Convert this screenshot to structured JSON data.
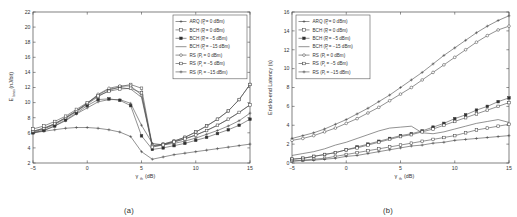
{
  "figure": {
    "panels": [
      {
        "caption": "(a)",
        "xlabel_main": "γ",
        "xlabel_sub": "th",
        "xlabel_unit": " (dB)",
        "ylabel_main": "E",
        "ylabel_sub": "bnos",
        "ylabel_unit": " (nJ/bit)"
      },
      {
        "caption": "(b)",
        "xlabel_main": "γ",
        "xlabel_sub": "th",
        "xlabel_unit": " (dB)",
        "ylabel_main": "End-to-end Latency (s)",
        "ylabel_sub": "",
        "ylabel_unit": ""
      }
    ],
    "legend_entries": [
      {
        "prefix": "ARQ (P",
        "sub": "t",
        "suffix": " = 0 dBm)",
        "marker": "plus"
      },
      {
        "prefix": "BCH (P",
        "sub": "t",
        "suffix": " = 0 dBm)",
        "marker": "square-open"
      },
      {
        "prefix": "BCH (P",
        "sub": "t",
        "suffix": " = −5 dBm)",
        "marker": "square-filled"
      },
      {
        "prefix": "BCH (P",
        "sub": "t",
        "suffix": " = −15 dBm)",
        "marker": "none"
      },
      {
        "prefix": "RS (P",
        "sub": "t",
        "suffix": " = 0 dBm)",
        "marker": "circle-open"
      },
      {
        "prefix": "RS (P",
        "sub": "t",
        "suffix": " = −5 dBm)",
        "marker": "square-open"
      },
      {
        "prefix": "RS (P",
        "sub": "t",
        "suffix": " = −15 dBm)",
        "marker": "plus"
      }
    ]
  },
  "chart_data": [
    {
      "type": "line",
      "panel": "a",
      "title": "",
      "xlabel": "γ_th (dB)",
      "ylabel": "E_bnos (nJ/bit)",
      "xlim": [
        -5,
        15
      ],
      "ylim": [
        2,
        22
      ],
      "xticks": [
        -5,
        0,
        5,
        10,
        15
      ],
      "yticks": [
        2,
        4,
        6,
        8,
        10,
        12,
        14,
        16,
        18,
        20,
        22
      ],
      "grid": false,
      "legend_position": "top-right",
      "x": [
        -5,
        -4,
        -3,
        -2,
        -1,
        0,
        1,
        2,
        3,
        4,
        5,
        6,
        7,
        8,
        9,
        10,
        11,
        12,
        13,
        14,
        15
      ],
      "series": [
        {
          "name": "ARQ (P_t = 0 dBm)",
          "marker": "plus",
          "values": [
            6.0,
            6.3,
            6.9,
            7.6,
            8.5,
            9.3,
            10.1,
            10.4,
            10.4,
            9.9,
            7.0,
            4.6,
            4.4,
            4.6,
            4.9,
            5.3,
            5.8,
            6.3,
            6.9,
            7.6,
            8.6
          ]
        },
        {
          "name": "BCH (P_t = 0 dBm)",
          "marker": "square-open",
          "values": [
            6.1,
            6.5,
            7.1,
            7.9,
            8.8,
            9.8,
            10.8,
            11.6,
            12.1,
            12.4,
            11.9,
            4.3,
            4.5,
            4.9,
            5.4,
            6.1,
            6.9,
            7.8,
            8.9,
            10.4,
            12.4
          ]
        },
        {
          "name": "BCH (P_t = −5 dBm)",
          "marker": "square-filled",
          "values": [
            6.0,
            6.3,
            6.9,
            7.7,
            8.6,
            9.6,
            10.4,
            10.5,
            10.3,
            9.6,
            5.6,
            3.8,
            4.0,
            4.3,
            4.6,
            5.0,
            5.4,
            5.9,
            6.4,
            7.0,
            7.8
          ]
        },
        {
          "name": "BCH (P_t = −15 dBm)",
          "marker": "none",
          "values": [
            6.2,
            6.6,
            7.2,
            8.0,
            8.9,
            9.9,
            11.0,
            11.8,
            12.0,
            11.8,
            10.7,
            4.2,
            4.4,
            4.8,
            5.2,
            5.7,
            6.3,
            7.0,
            7.8,
            8.7,
            9.7
          ]
        },
        {
          "name": "RS (P_t = 0 dBm)",
          "marker": "circle-open",
          "values": [
            6.2,
            6.6,
            7.2,
            8.0,
            8.9,
            9.9,
            11.1,
            11.9,
            12.2,
            12.2,
            11.0,
            4.3,
            4.5,
            4.9,
            5.4,
            6.1,
            6.9,
            7.8,
            8.9,
            10.4,
            12.4
          ]
        },
        {
          "name": "RS (P_t = −5 dBm)",
          "marker": "square-open",
          "values": [
            6.5,
            6.9,
            7.5,
            8.2,
            9.1,
            10.0,
            10.9,
            11.5,
            11.8,
            11.9,
            11.3,
            4.1,
            4.4,
            4.8,
            5.2,
            5.7,
            6.3,
            7.0,
            7.8,
            8.7,
            9.7
          ]
        },
        {
          "name": "RS (P_t = −15 dBm)",
          "marker": "plus",
          "values": [
            6.0,
            6.2,
            6.4,
            6.6,
            6.7,
            6.7,
            6.6,
            6.4,
            6.1,
            5.5,
            3.5,
            2.5,
            2.8,
            3.1,
            3.3,
            3.5,
            3.7,
            3.9,
            4.1,
            4.3,
            4.5
          ]
        }
      ]
    },
    {
      "type": "line",
      "panel": "b",
      "title": "",
      "xlabel": "γ_th (dB)",
      "ylabel": "End-to-end Latency (s)",
      "xlim": [
        -5,
        15
      ],
      "ylim": [
        0,
        16
      ],
      "xticks": [
        -5,
        0,
        5,
        10,
        15
      ],
      "yticks": [
        0,
        2,
        4,
        6,
        8,
        10,
        12,
        14,
        16
      ],
      "grid": false,
      "legend_position": "top-left",
      "x": [
        -5,
        -4,
        -3,
        -2,
        -1,
        0,
        1,
        2,
        3,
        4,
        5,
        6,
        7,
        8,
        9,
        10,
        11,
        12,
        13,
        14,
        15
      ],
      "series": [
        {
          "name": "ARQ (P_t = 0 dBm)",
          "marker": "plus",
          "values": [
            2.6,
            2.9,
            3.2,
            3.6,
            4.1,
            4.6,
            5.2,
            5.8,
            6.5,
            7.2,
            8.0,
            8.8,
            9.6,
            10.5,
            11.4,
            12.2,
            13.0,
            13.8,
            14.5,
            15.1,
            15.6
          ]
        },
        {
          "name": "BCH (P_t = 0 dBm)",
          "marker": "circle-open",
          "values": [
            2.4,
            2.6,
            2.9,
            3.3,
            3.7,
            4.2,
            4.7,
            5.3,
            5.9,
            6.6,
            7.3,
            8.0,
            8.8,
            9.6,
            10.4,
            11.2,
            12.0,
            12.8,
            13.5,
            14.1,
            14.5
          ]
        },
        {
          "name": "BCH (P_t = −5 dBm)",
          "marker": "square-filled",
          "values": [
            0.4,
            0.5,
            0.7,
            0.9,
            1.1,
            1.4,
            1.7,
            2.0,
            2.3,
            2.6,
            2.9,
            3.1,
            3.4,
            3.8,
            4.2,
            4.7,
            5.1,
            5.6,
            6.0,
            6.5,
            6.9
          ]
        },
        {
          "name": "BCH (P_t = −15 dBm)",
          "marker": "none",
          "values": [
            0.8,
            1.0,
            1.2,
            1.5,
            1.9,
            2.2,
            2.6,
            3.0,
            3.4,
            3.7,
            3.8,
            3.9,
            3.2,
            3.1,
            3.3,
            3.6,
            3.9,
            4.2,
            4.4,
            4.6,
            4.3
          ]
        },
        {
          "name": "RS (P_t = 0 dBm)",
          "marker": "square-open",
          "values": [
            0.4,
            0.5,
            0.7,
            0.9,
            1.1,
            1.4,
            1.6,
            1.9,
            2.2,
            2.5,
            2.8,
            3.0,
            3.3,
            3.6,
            4.0,
            4.4,
            4.8,
            5.2,
            5.6,
            6.0,
            6.4
          ]
        },
        {
          "name": "RS (P_t = −5 dBm)",
          "marker": "square-open",
          "values": [
            0.2,
            0.3,
            0.4,
            0.5,
            0.7,
            0.9,
            1.1,
            1.3,
            1.5,
            1.7,
            1.9,
            2.1,
            2.3,
            2.5,
            2.7,
            2.9,
            3.2,
            3.5,
            3.7,
            3.9,
            4.1
          ]
        },
        {
          "name": "RS (P_t = −15 dBm)",
          "marker": "plus",
          "values": [
            0.2,
            0.25,
            0.3,
            0.4,
            0.5,
            0.7,
            0.8,
            1.0,
            1.2,
            1.4,
            1.6,
            1.8,
            1.9,
            2.1,
            2.2,
            2.4,
            2.5,
            2.6,
            2.7,
            2.8,
            2.9
          ]
        }
      ]
    }
  ]
}
